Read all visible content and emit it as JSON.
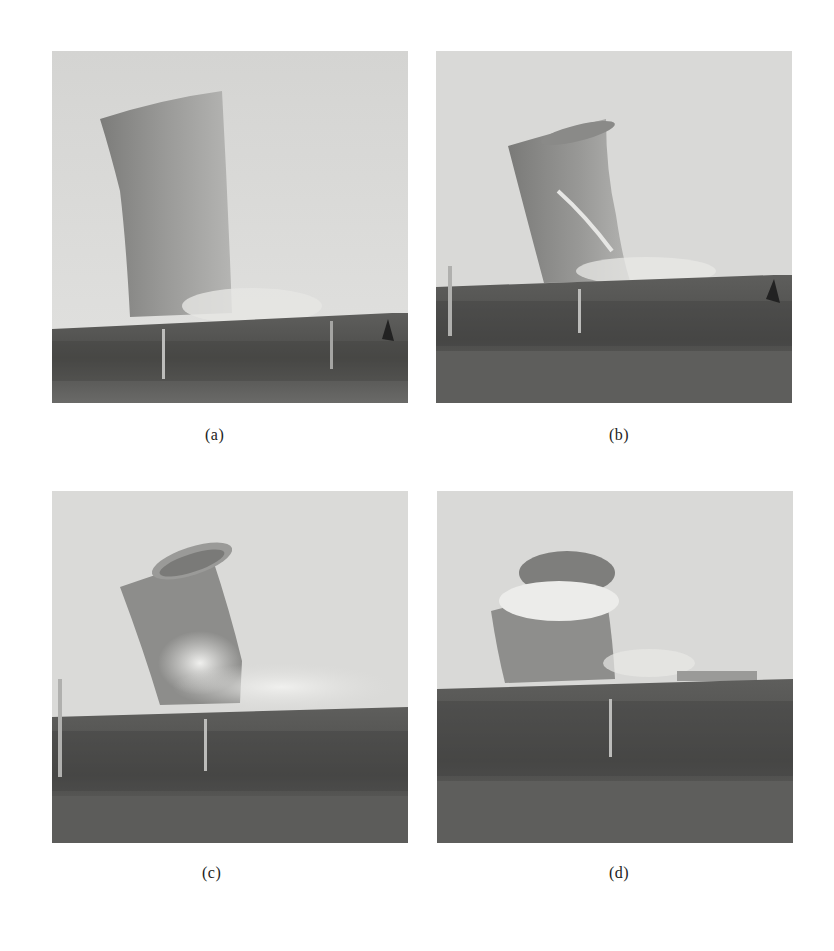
{
  "figure": {
    "panels": [
      {
        "id": "a",
        "caption": "(a)",
        "description": "Cooling tower beginning to tilt, intact shell"
      },
      {
        "id": "b",
        "caption": "(b)",
        "description": "Tower tilting further with shell tearing near base"
      },
      {
        "id": "c",
        "caption": "(c)",
        "description": "Tower collapsing, dust cloud erupting at base"
      },
      {
        "id": "d",
        "caption": "(d)",
        "description": "Tower shell falling, top opening visible with dust inside"
      }
    ]
  },
  "colors": {
    "sky": "#d8d8d6",
    "tower": "#8e8e8c",
    "tower_dark": "#6f6f6d",
    "ground": "#5a5a58",
    "vegetation": "#444442",
    "dust": "#e8e8e6"
  }
}
